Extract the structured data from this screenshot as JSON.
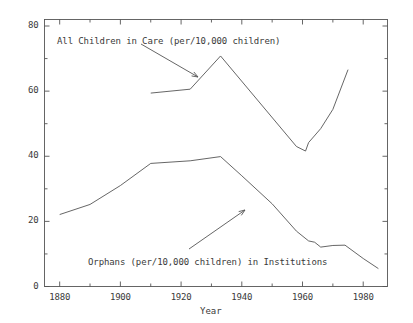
{
  "chart_data": {
    "type": "line",
    "title": "",
    "xlabel": "Year",
    "ylabel": "",
    "xlim": [
      1875,
      1988
    ],
    "ylim": [
      0,
      82
    ],
    "grid": false,
    "legend_position": "inline-annotations",
    "x_ticks": [
      "1880",
      "1900",
      "1920",
      "1940",
      "1960",
      "1980"
    ],
    "x_tick_values": [
      1880,
      1900,
      1920,
      1940,
      1960,
      1980
    ],
    "y_ticks": [
      "0",
      "20",
      "40",
      "60",
      "80"
    ],
    "y_tick_values": [
      0,
      20,
      40,
      60,
      80
    ],
    "x_minor_values": [
      1890,
      1910,
      1930,
      1950,
      1970
    ],
    "y_minor_values": [
      10,
      30,
      50,
      70
    ],
    "line_color": "#555555",
    "axis_color": "#555555",
    "text_color": "#3a3a3a",
    "background": "#ffffff",
    "series": [
      {
        "name": "All Children in Care (per/10,000 children)",
        "points": [
          [
            1910,
            59.4
          ],
          [
            1923,
            60.6
          ],
          [
            1933,
            70.8
          ],
          [
            1958,
            43.0
          ],
          [
            1961,
            41.6
          ],
          [
            1962,
            44.2
          ],
          [
            1966,
            48.5
          ],
          [
            1970,
            54.4
          ],
          [
            1975,
            66.6
          ]
        ]
      },
      {
        "name": "Orphans (per/10,000 children) in Institutions",
        "points": [
          [
            1880,
            22.1
          ],
          [
            1890,
            25.2
          ],
          [
            1900,
            31.0
          ],
          [
            1910,
            37.8
          ],
          [
            1923,
            38.6
          ],
          [
            1933,
            39.9
          ],
          [
            1940,
            34.0
          ],
          [
            1950,
            25.4
          ],
          [
            1958,
            17.0
          ],
          [
            1962,
            14.0
          ],
          [
            1964,
            13.6
          ],
          [
            1966,
            12.1
          ],
          [
            1970,
            12.6
          ],
          [
            1974,
            12.7
          ],
          [
            1980,
            8.6
          ],
          [
            1985,
            5.5
          ]
        ]
      }
    ],
    "annotations": [
      {
        "id": "annotation-all-children",
        "text": "All Children in Care (per/10,000 children)",
        "text_x": 57,
        "text_y": 36,
        "arrow_from": [
          141,
          44
        ],
        "arrow_to": [
          198,
          77
        ]
      },
      {
        "id": "annotation-orphans",
        "text": "Orphans (per/10,000 children) in Institutions",
        "text_x": 88,
        "text_y": 257,
        "arrow_from": [
          189,
          249
        ],
        "arrow_to": [
          245,
          210
        ]
      }
    ]
  },
  "axes": {
    "x_title": "Year"
  }
}
